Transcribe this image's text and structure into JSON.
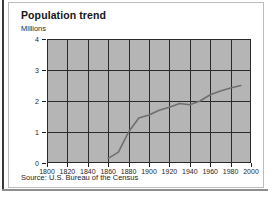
{
  "figure": {
    "card_title": "Population trend",
    "source_note": "Source: U.S. Bureau of the Census",
    "axis_color": "#1e1e1e",
    "plot_background": "#b5b5b5",
    "grid_color": "#2a2a2a",
    "line_color": "#6f6f6f",
    "card_background": "#ffffff",
    "card_border": "#bdbdbd"
  },
  "chart_data": {
    "type": "line",
    "title": "Population trend",
    "subtitle": "",
    "xlabel": "",
    "ylabel": "Millions",
    "xlim": [
      1800,
      2000
    ],
    "ylim": [
      0,
      4
    ],
    "grid": true,
    "legend": "none",
    "xticks": [
      1800,
      1820,
      1840,
      1860,
      1880,
      1900,
      1920,
      1940,
      1960,
      1980,
      2000
    ],
    "xtick_labels": [
      "1800",
      "1820",
      "1840",
      "1860",
      "1880",
      "1900",
      "1920",
      "1940",
      "1960",
      "1980",
      "2000"
    ],
    "yticks": [
      0,
      1,
      2,
      3,
      4
    ],
    "ytick_labels": [
      "0",
      "1",
      "2",
      "3",
      "4"
    ],
    "series": [
      {
        "name": "Population",
        "units": "millions",
        "x": [
          1860,
          1870,
          1880,
          1890,
          1900,
          1910,
          1920,
          1930,
          1940,
          1950,
          1960,
          1970,
          1980,
          1990
        ],
        "values": [
          0.15,
          0.35,
          1.0,
          1.45,
          1.55,
          1.7,
          1.8,
          1.92,
          1.88,
          2.0,
          2.2,
          2.32,
          2.42,
          2.5
        ]
      }
    ]
  }
}
